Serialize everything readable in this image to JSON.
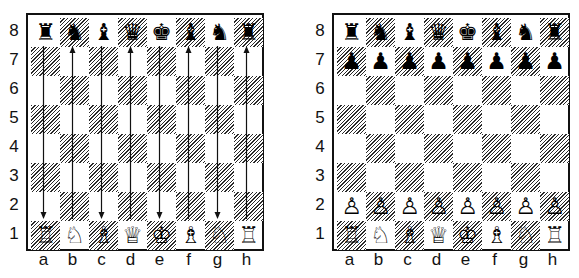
{
  "diagrams": [
    {
      "id": "left",
      "rank_labels": [
        "8",
        "7",
        "6",
        "5",
        "4",
        "3",
        "2",
        "1"
      ],
      "file_labels": [
        "a",
        "b",
        "c",
        "d",
        "e",
        "f",
        "g",
        "h"
      ],
      "rows": [
        [
          "♜",
          "♞",
          "♝",
          "♛",
          "♚",
          "♝",
          "♞",
          "♜"
        ],
        [
          "",
          "",
          "",
          "",
          "",
          "",
          "",
          ""
        ],
        [
          "",
          "",
          "",
          "",
          "",
          "",
          "",
          ""
        ],
        [
          "",
          "",
          "",
          "",
          "",
          "",
          "",
          ""
        ],
        [
          "",
          "",
          "",
          "",
          "",
          "",
          "",
          ""
        ],
        [
          "",
          "",
          "",
          "",
          "",
          "",
          "",
          ""
        ],
        [
          "",
          "",
          "",
          "",
          "",
          "",
          "",
          ""
        ],
        [
          "♖",
          "♘",
          "♗",
          "♕",
          "♔",
          "♗",
          "♘",
          "♖"
        ]
      ],
      "arrows": [
        {
          "file": "a",
          "direction": "down"
        },
        {
          "file": "b",
          "direction": "up"
        },
        {
          "file": "c",
          "direction": "down"
        },
        {
          "file": "d",
          "direction": "up"
        },
        {
          "file": "e",
          "direction": "down"
        },
        {
          "file": "f",
          "direction": "up"
        },
        {
          "file": "g",
          "direction": "down"
        },
        {
          "file": "h",
          "direction": "up"
        }
      ]
    },
    {
      "id": "right",
      "rank_labels": [
        "8",
        "7",
        "6",
        "5",
        "4",
        "3",
        "2",
        "1"
      ],
      "file_labels": [
        "a",
        "b",
        "c",
        "d",
        "e",
        "f",
        "g",
        "h"
      ],
      "rows": [
        [
          "♜",
          "♞",
          "♝",
          "♛",
          "♚",
          "♝",
          "♞",
          "♜"
        ],
        [
          "♟",
          "♟",
          "♟",
          "♟",
          "♟",
          "♟",
          "♟",
          "♟"
        ],
        [
          "",
          "",
          "",
          "",
          "",
          "",
          "",
          ""
        ],
        [
          "",
          "",
          "",
          "",
          "",
          "",
          "",
          ""
        ],
        [
          "",
          "",
          "",
          "",
          "",
          "",
          "",
          ""
        ],
        [
          "",
          "",
          "",
          "",
          "",
          "",
          "",
          ""
        ],
        [
          "♙",
          "♙",
          "♙",
          "♙",
          "♙",
          "♙",
          "♙",
          "♙"
        ],
        [
          "♖",
          "♘",
          "♗",
          "♕",
          "♔",
          "♗",
          "♘",
          "♖"
        ]
      ],
      "arrows": []
    }
  ],
  "colors": {
    "border": "#111111",
    "dark_square_hatch": "#2a2a2a",
    "light_square": "#ffffff"
  }
}
